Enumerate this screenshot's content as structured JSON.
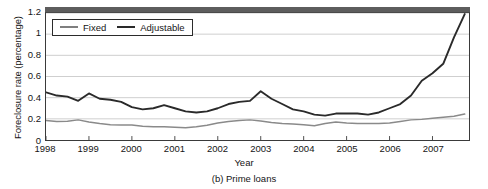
{
  "figure": {
    "caption": "(b) Prime loans"
  },
  "chart_data": {
    "type": "line",
    "title": "",
    "xlabel": "Year",
    "ylabel": "Foreclosure rate (percentage)",
    "xlim": [
      1998.0,
      2007.85
    ],
    "ylim": [
      0,
      1.2
    ],
    "grid": true,
    "legend_position": "top-left",
    "xticks": [
      1998,
      1999,
      2000,
      2001,
      2002,
      2003,
      2004,
      2005,
      2006,
      2007
    ],
    "xticklabels": [
      "1998",
      "1999",
      "2000",
      "2001",
      "2002",
      "2003",
      "2004",
      "2005",
      "2006",
      "2007"
    ],
    "yticks": [
      0,
      0.2,
      0.4,
      0.6,
      0.8,
      1,
      1.2
    ],
    "yticklabels": [
      "0",
      "0.2",
      "0.4",
      "0.6",
      "0.8",
      "1",
      "1.2"
    ],
    "series": [
      {
        "name": "Adjustable",
        "color": "#2a2a2a",
        "width": 1.9,
        "x": [
          1998.0,
          1998.25,
          1998.5,
          1998.75,
          1999.0,
          1999.25,
          1999.5,
          1999.75,
          2000.0,
          2000.25,
          2000.5,
          2000.75,
          2001.0,
          2001.25,
          2001.5,
          2001.75,
          2002.0,
          2002.25,
          2002.5,
          2002.75,
          2003.0,
          2003.25,
          2003.5,
          2003.75,
          2004.0,
          2004.25,
          2004.5,
          2004.75,
          2005.0,
          2005.25,
          2005.5,
          2005.75,
          2006.0,
          2006.25,
          2006.5,
          2006.75,
          2007.0,
          2007.25,
          2007.5,
          2007.75
        ],
        "y": [
          0.45,
          0.42,
          0.41,
          0.37,
          0.44,
          0.39,
          0.38,
          0.36,
          0.31,
          0.29,
          0.3,
          0.33,
          0.3,
          0.27,
          0.26,
          0.27,
          0.3,
          0.34,
          0.36,
          0.37,
          0.46,
          0.39,
          0.34,
          0.29,
          0.27,
          0.24,
          0.23,
          0.25,
          0.25,
          0.25,
          0.24,
          0.26,
          0.3,
          0.34,
          0.42,
          0.56,
          0.63,
          0.72,
          0.97,
          1.19
        ]
      },
      {
        "name": "Fixed",
        "color": "#8a8a8a",
        "width": 1.5,
        "x": [
          1998.0,
          1998.25,
          1998.5,
          1998.75,
          1999.0,
          1999.25,
          1999.5,
          1999.75,
          2000.0,
          2000.25,
          2000.5,
          2000.75,
          2001.0,
          2001.25,
          2001.5,
          2001.75,
          2002.0,
          2002.25,
          2002.5,
          2002.75,
          2003.0,
          2003.25,
          2003.5,
          2003.75,
          2004.0,
          2004.25,
          2004.5,
          2004.75,
          2005.0,
          2005.25,
          2005.5,
          2005.75,
          2006.0,
          2006.25,
          2006.5,
          2006.75,
          2007.0,
          2007.25,
          2007.5,
          2007.75
        ],
        "y": [
          0.185,
          0.175,
          0.178,
          0.19,
          0.17,
          0.155,
          0.145,
          0.142,
          0.142,
          0.13,
          0.125,
          0.125,
          0.12,
          0.115,
          0.125,
          0.14,
          0.16,
          0.175,
          0.185,
          0.19,
          0.18,
          0.165,
          0.155,
          0.152,
          0.145,
          0.135,
          0.155,
          0.17,
          0.16,
          0.155,
          0.155,
          0.155,
          0.16,
          0.175,
          0.19,
          0.195,
          0.205,
          0.215,
          0.225,
          0.245
        ]
      }
    ]
  },
  "legend": {
    "entries": [
      {
        "label": "Fixed"
      },
      {
        "label": "Adjustable"
      }
    ]
  }
}
